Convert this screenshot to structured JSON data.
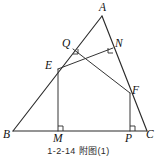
{
  "figure": {
    "type": "euclidean-geometry-diagram",
    "caption": "1-2-14 附图(1)",
    "canvas": {
      "width": 157,
      "height": 157
    },
    "stroke_color": "#2b2b2b",
    "background_color": "#ffffff",
    "points": [
      {
        "id": "A",
        "label": "A",
        "x": 102,
        "y": 16,
        "label_x": 99,
        "label_y": 2
      },
      {
        "id": "B",
        "label": "B",
        "x": 13,
        "y": 131,
        "label_x": 3,
        "label_y": 129
      },
      {
        "id": "C",
        "label": "C",
        "x": 147,
        "y": 131,
        "label_x": 146,
        "label_y": 129
      },
      {
        "id": "E",
        "label": "E",
        "x": 58,
        "y": 69,
        "label_x": 45,
        "label_y": 60
      },
      {
        "id": "M",
        "label": "M",
        "x": 58,
        "y": 131,
        "label_x": 53,
        "label_y": 133
      },
      {
        "id": "F",
        "label": "F",
        "x": 130,
        "y": 93,
        "label_x": 132,
        "label_y": 85
      },
      {
        "id": "P",
        "label": "P",
        "x": 130,
        "y": 131,
        "label_x": 125,
        "label_y": 133
      },
      {
        "id": "Q",
        "label": "Q",
        "x": 73,
        "y": 49,
        "label_x": 62,
        "label_y": 38
      },
      {
        "id": "N",
        "label": "N",
        "x": 113,
        "y": 48,
        "label_x": 115,
        "label_y": 38
      }
    ],
    "segments": [
      {
        "name": "side-AB",
        "from": "A",
        "to": "B",
        "weight": "normal"
      },
      {
        "name": "side-AC",
        "from": "A",
        "to": "C",
        "weight": "normal"
      },
      {
        "name": "side-BC",
        "from": "B",
        "to": "C",
        "weight": "normal"
      },
      {
        "name": "altitude-EM",
        "from": "E",
        "to": "M",
        "weight": "thin"
      },
      {
        "name": "altitude-FP",
        "from": "F",
        "to": "P",
        "weight": "thin"
      },
      {
        "name": "cevian-EN",
        "from": "E",
        "to": "N",
        "weight": "thin"
      },
      {
        "name": "cevian-QF",
        "from": "Q",
        "to": "F",
        "weight": "thin"
      }
    ],
    "right_angles": [
      {
        "name": "right-angle-at-M",
        "at": "M",
        "dir_x": 1,
        "dir_y": -1,
        "size": 5
      },
      {
        "name": "right-angle-at-P",
        "at": "P",
        "dir_x": 1,
        "dir_y": -1,
        "size": 5
      },
      {
        "name": "right-angle-at-Q",
        "at": "Q",
        "dir_x": 1,
        "dir_y": 1,
        "size": 5
      },
      {
        "name": "right-angle-at-N",
        "at": "N",
        "dir_x": -1,
        "dir_y": 1,
        "size": 5
      }
    ]
  }
}
